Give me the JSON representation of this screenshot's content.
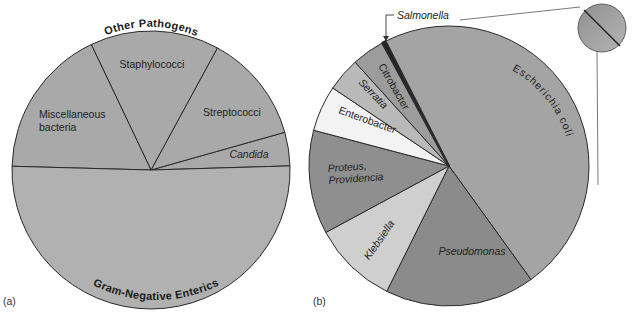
{
  "figure": {
    "panel_a_label": "(a)",
    "panel_b_label": "(b)",
    "caption_visible": "",
    "colors": {
      "stroke": "#2a2a2a",
      "background": "#ffffff"
    }
  },
  "chart_data": [
    {
      "type": "pie",
      "title": "",
      "panel": "(a)",
      "center": [
        151,
        170
      ],
      "radius": 139,
      "start_angle_deg": -1.7,
      "direction": "counterclockwise",
      "group_labels": [
        {
          "text": "Other Pathogens",
          "position": "top-arc"
        },
        {
          "text": "Gram-Negative Enterics",
          "position": "bottom-arc"
        }
      ],
      "slices": [
        {
          "label": "Candida",
          "value": 3.9,
          "color": "#a9a9a9",
          "italic": true,
          "group": "Other Pathogens"
        },
        {
          "label": "Streptococci",
          "value": 12.7,
          "color": "#a9a9a9",
          "italic": false,
          "group": "Other Pathogens"
        },
        {
          "label": "Staphylococci",
          "value": 15.0,
          "color": "#a9a9a9",
          "italic": false,
          "group": "Other Pathogens"
        },
        {
          "label": "Miscellaneous bacteria",
          "value": 17.5,
          "color": "#a9a9a9",
          "italic": false,
          "group": "Other Pathogens"
        },
        {
          "label": "Gram-Negative Enterics",
          "value": 50.9,
          "color": "#b1b1b1",
          "italic": false,
          "group": "Gram-Negative Enterics"
        }
      ]
    },
    {
      "type": "pie",
      "title": "",
      "panel": "(b)",
      "center": [
        449,
        166
      ],
      "radius": 140,
      "start_angle_deg": -117.0,
      "direction": "clockwise",
      "slices": [
        {
          "label": "Escherichia coli",
          "value": 47.6,
          "color": "#a4a4a4",
          "italic": false
        },
        {
          "label": "Pseudomonas",
          "value": 17.3,
          "color": "#8b8b8b",
          "italic": true
        },
        {
          "label": "Klebsiella",
          "value": 9.8,
          "color": "#cfcfcf",
          "italic": true
        },
        {
          "label": "Proteus, Providencia",
          "value": 12.0,
          "color": "#8f8f8f",
          "italic": true
        },
        {
          "label": "Enterobacter",
          "value": 5.3,
          "color": "#f3f3f3",
          "italic": false
        },
        {
          "label": "Serratia",
          "value": 3.9,
          "color": "#b9b9b9",
          "italic": true
        },
        {
          "label": "Citrobacter",
          "value": 3.8,
          "color": "#9c9c9c",
          "italic": false
        },
        {
          "label": "Salmonella",
          "value": 0.4,
          "color": "#1e1e1e",
          "italic": true
        }
      ],
      "inset": {
        "description": "magnified view of Salmonella sliver",
        "center": [
          602,
          28
        ],
        "radius": 24
      }
    }
  ]
}
